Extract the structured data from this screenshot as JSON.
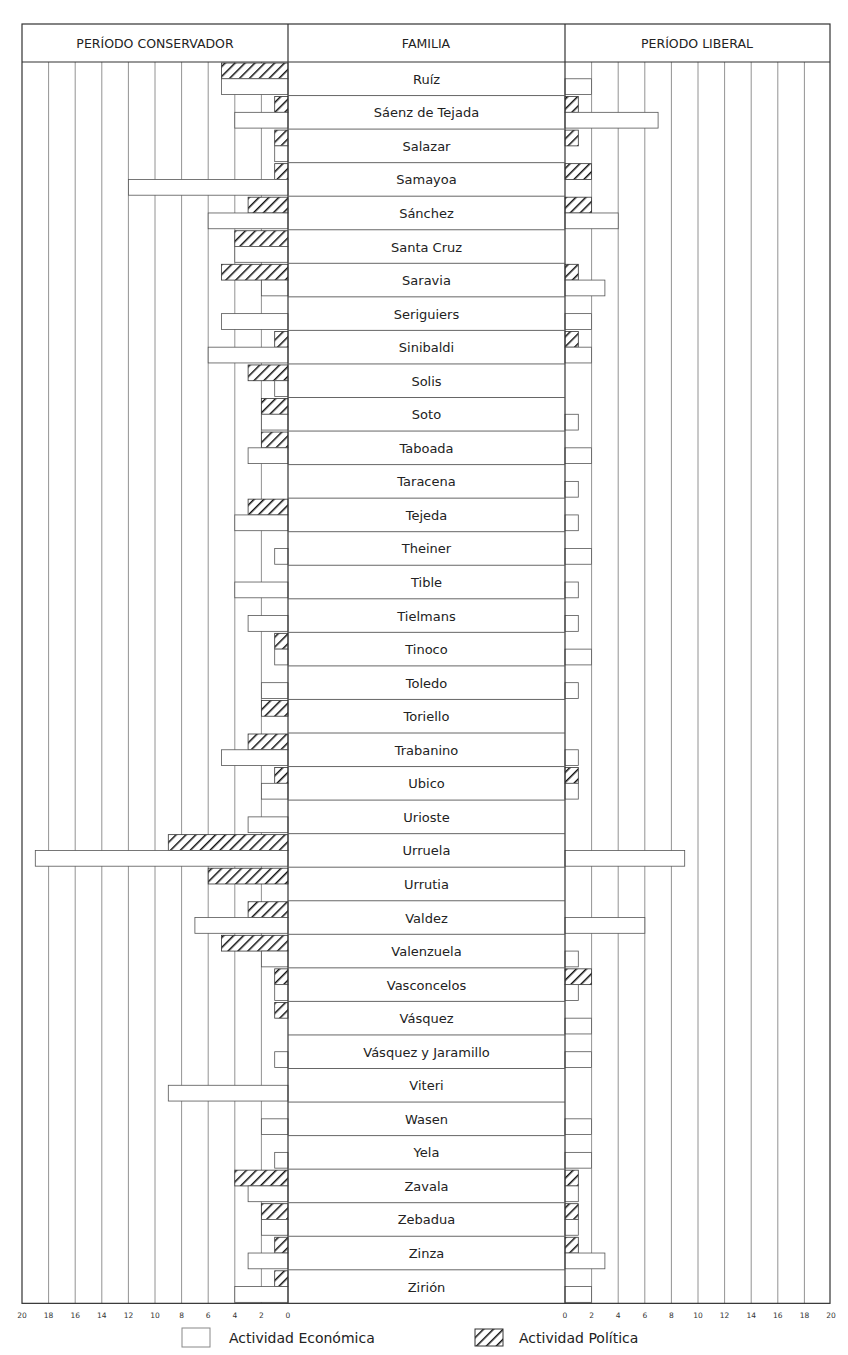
{
  "header": {
    "left": "PERÍODO CONSERVADOR",
    "center": "FAMILIA",
    "right": "PERÍODO LIBERAL"
  },
  "legend": {
    "economic": "Actividad Económica",
    "political": "Actividad Política"
  },
  "axis": {
    "left_ticks": [
      "20",
      "18",
      "16",
      "14",
      "12",
      "10",
      "8",
      "6",
      "4",
      "2",
      "0"
    ],
    "right_ticks": [
      "0",
      "2",
      "4",
      "6",
      "8",
      "10",
      "12",
      "14",
      "16",
      "18",
      "20"
    ]
  },
  "colors": {
    "line": "#555555",
    "grid": "#777777",
    "hatch": "#111111",
    "fill": "#ffffff"
  },
  "chart_data": {
    "type": "bar",
    "orientation": "horizontal-butterfly",
    "title": "",
    "left_panel_label": "PERÍODO CONSERVADOR",
    "right_panel_label": "PERÍODO LIBERAL",
    "category_label": "FAMILIA",
    "xlim": [
      0,
      20
    ],
    "grid": true,
    "legend": [
      "Actividad Económica",
      "Actividad Política"
    ],
    "categories": [
      "Ruíz",
      "Sáenz de Tejada",
      "Salazar",
      "Samayoa",
      "Sánchez",
      "Santa Cruz",
      "Saravia",
      "Seriguiers",
      "Sinibaldi",
      "Solis",
      "Soto",
      "Taboada",
      "Taracena",
      "Tejeda",
      "Theiner",
      "Tible",
      "Tielmans",
      "Tinoco",
      "Toledo",
      "Toriello",
      "Trabanino",
      "Ubico",
      "Urioste",
      "Urruela",
      "Urrutia",
      "Valdez",
      "Valenzuela",
      "Vasconcelos",
      "Vásquez",
      "Vásquez y Jaramillo",
      "Viteri",
      "Wasen",
      "Yela",
      "Zavala",
      "Zebadua",
      "Zinza",
      "Zirión"
    ],
    "series": [
      {
        "name": "Conservador - Actividad Política",
        "panel": "left",
        "style": "hatched",
        "values": [
          5,
          1,
          1,
          1,
          3,
          4,
          5,
          0,
          1,
          3,
          2,
          2,
          0,
          3,
          0,
          0,
          0,
          1,
          0,
          2,
          3,
          1,
          0,
          9,
          6,
          3,
          5,
          1,
          1,
          0,
          0,
          0,
          0,
          4,
          2,
          1,
          1
        ]
      },
      {
        "name": "Conservador - Actividad Económica",
        "panel": "left",
        "style": "plain",
        "values": [
          5,
          4,
          1,
          12,
          6,
          4,
          2,
          5,
          6,
          1,
          2,
          3,
          0,
          4,
          1,
          4,
          3,
          1,
          2,
          0,
          5,
          2,
          3,
          19,
          0,
          7,
          2,
          1,
          0,
          1,
          9,
          2,
          1,
          3,
          2,
          3,
          4
        ]
      },
      {
        "name": "Liberal - Actividad Política",
        "panel": "right",
        "style": "hatched",
        "values": [
          0,
          1,
          1,
          2,
          2,
          0,
          1,
          0,
          1,
          0,
          0,
          0,
          0,
          0,
          0,
          0,
          0,
          0,
          0,
          0,
          0,
          1,
          0,
          0,
          0,
          0,
          0,
          2,
          0,
          0,
          0,
          0,
          0,
          1,
          1,
          1,
          0
        ]
      },
      {
        "name": "Liberal - Actividad Económica",
        "panel": "right",
        "style": "plain",
        "values": [
          2,
          7,
          0,
          0,
          4,
          0,
          3,
          2,
          2,
          0,
          1,
          2,
          1,
          1,
          2,
          1,
          1,
          2,
          1,
          0,
          1,
          1,
          0,
          9,
          0,
          6,
          1,
          1,
          2,
          2,
          0,
          2,
          2,
          1,
          1,
          3,
          2
        ]
      }
    ]
  }
}
